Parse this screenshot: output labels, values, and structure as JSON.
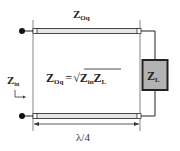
{
  "diagram": {
    "line_label": {
      "main": "Z",
      "sub": "Oq"
    },
    "input_label": {
      "main": "Z",
      "sub": "in"
    },
    "load_label": {
      "main": "Z",
      "sub": "L"
    },
    "equation": {
      "lhs_main": "Z",
      "lhs_sub": "Oq",
      "equals": "=",
      "sqrt": "√",
      "rhs1_main": "Z",
      "rhs1_sub": "in",
      "rhs2_main": "Z",
      "rhs2_sub": "L"
    },
    "length_label": "λ/4",
    "colors": {
      "line_fill": "#e6e6e6",
      "load_fill": "#b3b3b3",
      "stroke": "#222222"
    }
  }
}
